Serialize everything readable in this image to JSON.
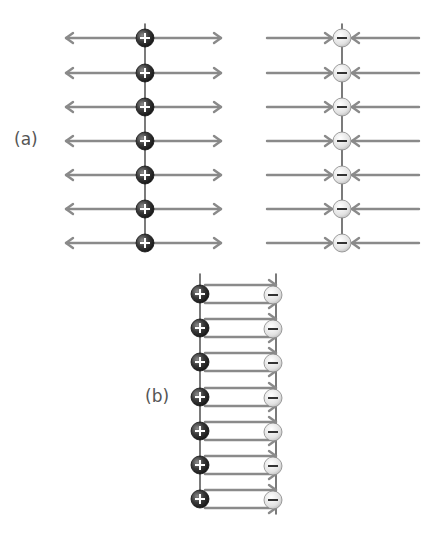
{
  "panel_a": {
    "label": "(a)",
    "rows": 7,
    "row_y": [
      38,
      73,
      107,
      141,
      175,
      209,
      243
    ],
    "positive_sheet": {
      "x": 145,
      "charge_symbol": "+",
      "field": "outward"
    },
    "negative_sheet": {
      "x": 342,
      "charge_symbol": "−",
      "field": "inward"
    }
  },
  "panel_b": {
    "label": "(b)",
    "rows": 7,
    "row_y": [
      294,
      328,
      362,
      397,
      431,
      465,
      499
    ],
    "positive_x": 200,
    "negative_x": 273,
    "charge_symbols": {
      "positive": "+",
      "negative": "−"
    },
    "field": "left-to-right between plates"
  },
  "colors": {
    "arrow": "#8a8a8a",
    "axis": "#333333",
    "positive_fill": "#2e2e2e",
    "negative_fill": "#e6e6e6"
  }
}
